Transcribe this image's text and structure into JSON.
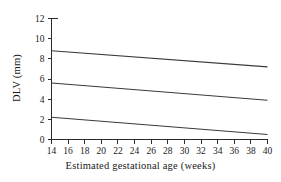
{
  "figure": {
    "background": "#ffffff",
    "line_color": "#3a3a3a",
    "axis_color": "#2b2b2b"
  },
  "chart_data": {
    "type": "line",
    "title": "",
    "xlabel": "Estimated gestational age (weeks)",
    "ylabel": "DLV (mm)",
    "xlim": [
      14,
      40
    ],
    "ylim": [
      0,
      12
    ],
    "xticks": [
      14,
      16,
      18,
      20,
      22,
      24,
      26,
      28,
      30,
      32,
      34,
      36,
      38,
      40
    ],
    "yticks": [
      0,
      2,
      4,
      6,
      8,
      10,
      12
    ],
    "xticklabels": [
      "14",
      "16",
      "18",
      "20",
      "22",
      "24",
      "26",
      "28",
      "30",
      "32",
      "34",
      "36",
      "38",
      "40"
    ],
    "yticklabels": [
      "0",
      "2",
      "4",
      "6",
      "8",
      "10",
      "12"
    ],
    "grid": false,
    "legend": false,
    "legend_position": "none",
    "x": [
      14,
      40
    ],
    "series": [
      {
        "name": "upper-centile",
        "values": [
          8.8,
          7.2
        ]
      },
      {
        "name": "median",
        "values": [
          5.6,
          3.9
        ]
      },
      {
        "name": "lower-centile",
        "values": [
          2.2,
          0.5
        ]
      }
    ],
    "annotations": []
  }
}
